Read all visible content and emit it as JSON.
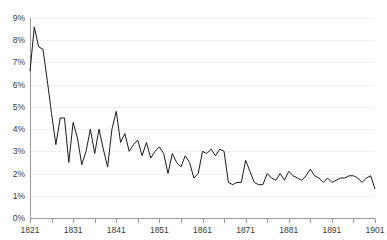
{
  "chart_data": {
    "type": "line",
    "title": "",
    "subtitle": "",
    "xlabel": "",
    "ylabel": "",
    "xlim": [
      1821,
      1901
    ],
    "ylim": [
      0,
      9
    ],
    "grid": true,
    "legend": false,
    "y_tick_labels": [
      "0%",
      "1%",
      "2%",
      "3%",
      "4%",
      "5%",
      "6%",
      "7%",
      "8%",
      "9%"
    ],
    "y_tick_values": [
      0,
      1,
      2,
      3,
      4,
      5,
      6,
      7,
      8,
      9
    ],
    "x_tick_labels": [
      "1821",
      "1831",
      "1841",
      "1851",
      "1861",
      "1871",
      "1881",
      "1891",
      "1901"
    ],
    "x_tick_values": [
      1821,
      1831,
      1841,
      1851,
      1861,
      1871,
      1881,
      1891,
      1901
    ],
    "x_minor_tick_values": [
      1826,
      1836,
      1846,
      1856,
      1866,
      1876,
      1886,
      1896
    ],
    "series": [
      {
        "name": "rate",
        "color": "#1a1a1a",
        "x": [
          1821,
          1822,
          1823,
          1824,
          1825,
          1826,
          1827,
          1828,
          1829,
          1830,
          1831,
          1832,
          1833,
          1834,
          1835,
          1836,
          1837,
          1838,
          1839,
          1840,
          1841,
          1842,
          1843,
          1844,
          1845,
          1846,
          1847,
          1848,
          1849,
          1850,
          1851,
          1852,
          1853,
          1854,
          1855,
          1856,
          1857,
          1858,
          1859,
          1860,
          1861,
          1862,
          1863,
          1864,
          1865,
          1866,
          1867,
          1868,
          1869,
          1870,
          1871,
          1872,
          1873,
          1874,
          1875,
          1876,
          1877,
          1878,
          1879,
          1880,
          1881,
          1882,
          1883,
          1884,
          1885,
          1886,
          1887,
          1888,
          1889,
          1890,
          1891,
          1892,
          1893,
          1894,
          1895,
          1896,
          1897,
          1898,
          1899,
          1900,
          1901
        ],
        "values": [
          6.6,
          8.6,
          7.7,
          7.6,
          6.2,
          4.7,
          3.3,
          4.5,
          4.5,
          2.5,
          4.3,
          3.6,
          2.4,
          3.0,
          4.0,
          2.9,
          4.0,
          3.1,
          2.3,
          4.0,
          4.8,
          3.4,
          3.8,
          3.0,
          3.3,
          3.5,
          2.8,
          3.4,
          2.7,
          3.0,
          3.2,
          2.9,
          2.0,
          2.9,
          2.5,
          2.3,
          2.8,
          2.5,
          1.8,
          2.0,
          3.0,
          2.9,
          3.1,
          2.8,
          3.1,
          3.0,
          1.6,
          1.5,
          1.6,
          1.6,
          2.6,
          2.1,
          1.6,
          1.5,
          1.5,
          2.0,
          1.8,
          1.7,
          2.0,
          1.7,
          2.1,
          1.9,
          1.8,
          1.7,
          1.9,
          2.2,
          1.9,
          1.8,
          1.6,
          1.8,
          1.6,
          1.7,
          1.8,
          1.8,
          1.9,
          1.9,
          1.8,
          1.6,
          1.8,
          1.9,
          1.3
        ]
      }
    ]
  }
}
